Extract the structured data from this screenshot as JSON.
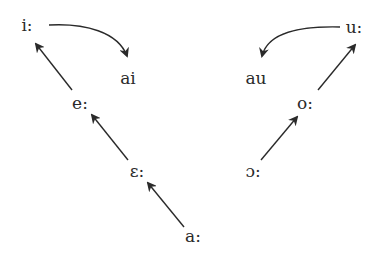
{
  "diagram": {
    "nodes": [
      {
        "id": "i_long",
        "label": "i:",
        "x": 27,
        "y": 25
      },
      {
        "id": "ai",
        "label": "ai",
        "x": 128,
        "y": 78
      },
      {
        "id": "e_long",
        "label": "e:",
        "x": 80,
        "y": 103
      },
      {
        "id": "epsilon_long",
        "label": "ɛ:",
        "x": 137,
        "y": 171
      },
      {
        "id": "a_long",
        "label": "a:",
        "x": 193,
        "y": 236
      },
      {
        "id": "u_long",
        "label": "u:",
        "x": 354,
        "y": 27
      },
      {
        "id": "au",
        "label": "au",
        "x": 256,
        "y": 78
      },
      {
        "id": "o_long",
        "label": "o:",
        "x": 305,
        "y": 103
      },
      {
        "id": "open_o_long",
        "label": "ɔ:",
        "x": 253,
        "y": 171
      }
    ],
    "edges": [
      {
        "from": "a_long",
        "to": "epsilon_long",
        "type": "straight"
      },
      {
        "from": "epsilon_long",
        "to": "e_long",
        "type": "straight"
      },
      {
        "from": "e_long",
        "to": "i_long",
        "type": "straight"
      },
      {
        "from": "i_long",
        "to": "ai",
        "type": "curved"
      },
      {
        "from": "open_o_long",
        "to": "o_long",
        "type": "straight"
      },
      {
        "from": "o_long",
        "to": "u_long",
        "type": "straight"
      },
      {
        "from": "u_long",
        "to": "au",
        "type": "curved"
      }
    ],
    "colors": {
      "stroke": "#2a2a2a",
      "text": "#2a2a2a",
      "background": "#ffffff"
    }
  },
  "labels": {
    "i_long": "i:",
    "ai": "ai",
    "e_long": "e:",
    "epsilon_long": "ɛ:",
    "a_long": "a:",
    "u_long": "u:",
    "au": "au",
    "o_long": "o:",
    "open_o_long": "ɔ:"
  }
}
